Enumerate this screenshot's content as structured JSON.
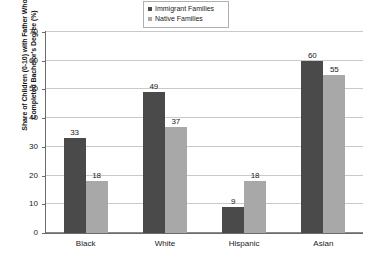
{
  "chart_data": {
    "type": "bar",
    "title": "",
    "xlabel": "",
    "ylabel": "Share of Children (0-10) with Father Who Completed Bachelor's Degree (%)",
    "ylabel_lines": [
      "Share of Children (0-10) with Father Who",
      "Completed Bachelor's Degree (%)"
    ],
    "categories": [
      "Black",
      "White",
      "Hispanic",
      "Asian"
    ],
    "series": [
      {
        "name": "Immigrant Families",
        "color": "#4a4a4a",
        "values": [
          33,
          49,
          9,
          60
        ]
      },
      {
        "name": "Native Families",
        "color": "#a8a8a8",
        "values": [
          18,
          37,
          18,
          55
        ]
      }
    ],
    "ylim": [
      0,
      70
    ],
    "yticks": [
      0,
      10,
      20,
      30,
      40,
      50,
      60,
      70
    ],
    "ytick_labels": [
      "0",
      "10",
      "20",
      "30",
      "40",
      "50",
      "60",
      "70"
    ],
    "grid": true,
    "legend_position": "top-center",
    "value_labels": [
      33,
      18,
      49,
      37,
      9,
      18,
      60,
      55
    ]
  },
  "legend": {
    "items": [
      {
        "label": "Immigrant Families",
        "color": "#4a4a4a"
      },
      {
        "label": "Native Families",
        "color": "#a8a8a8"
      }
    ]
  }
}
